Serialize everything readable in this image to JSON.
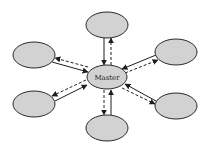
{
  "diagram": {
    "type": "star-topology",
    "colors": {
      "node_fill": "#d2d2d2",
      "stroke": "#1e1e1e",
      "background": "#ffffff"
    },
    "master": {
      "label": "Master",
      "cx": 107,
      "cy": 77,
      "rx": 20,
      "ry": 12
    },
    "nodes": [
      {
        "id": "top",
        "label": "",
        "cx": 107,
        "cy": 25,
        "rx": 21,
        "ry": 13
      },
      {
        "id": "upper-left",
        "label": "",
        "cx": 34,
        "cy": 55,
        "rx": 21,
        "ry": 13
      },
      {
        "id": "upper-right",
        "label": "",
        "cx": 176,
        "cy": 52,
        "rx": 21,
        "ry": 13
      },
      {
        "id": "lower-left",
        "label": "",
        "cx": 34,
        "cy": 104,
        "rx": 21,
        "ry": 13
      },
      {
        "id": "lower-right",
        "label": "",
        "cx": 176,
        "cy": 106,
        "rx": 21,
        "ry": 13
      },
      {
        "id": "bottom",
        "label": "",
        "cx": 107,
        "cy": 128,
        "rx": 21,
        "ry": 13
      }
    ],
    "edges": [
      {
        "from": "top",
        "to": "master",
        "style": "solid",
        "direction": "to-master"
      },
      {
        "from": "master",
        "to": "top",
        "style": "dashed",
        "direction": "to-node"
      },
      {
        "from": "upper-left",
        "to": "master",
        "style": "solid",
        "direction": "to-master"
      },
      {
        "from": "master",
        "to": "upper-left",
        "style": "dashed",
        "direction": "to-node"
      },
      {
        "from": "upper-right",
        "to": "master",
        "style": "solid",
        "direction": "to-master"
      },
      {
        "from": "master",
        "to": "upper-right",
        "style": "dashed",
        "direction": "to-node"
      },
      {
        "from": "lower-left",
        "to": "master",
        "style": "solid",
        "direction": "to-master"
      },
      {
        "from": "master",
        "to": "lower-left",
        "style": "dashed",
        "direction": "to-node"
      },
      {
        "from": "lower-right",
        "to": "master",
        "style": "solid",
        "direction": "to-master"
      },
      {
        "from": "master",
        "to": "lower-right",
        "style": "dashed",
        "direction": "to-node"
      },
      {
        "from": "bottom",
        "to": "master",
        "style": "solid",
        "direction": "to-master"
      },
      {
        "from": "master",
        "to": "bottom",
        "style": "dashed",
        "direction": "to-node"
      }
    ]
  }
}
